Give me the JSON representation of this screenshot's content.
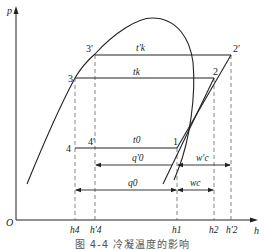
{
  "figure": {
    "caption": "图 4-4  冷凝温度的影响",
    "axes": {
      "y_label": "p",
      "x_label": "h",
      "origin_label": "O"
    },
    "points": {
      "p1": "1",
      "p2": "2",
      "p2p": "2′",
      "p3": "3",
      "p3p": "3′",
      "p4": "4",
      "p4p": "4′"
    },
    "line_labels": {
      "tk_prime": "t′k",
      "tk": "tk",
      "t0": "t0"
    },
    "dimension_labels": {
      "q0_prime": "q′0",
      "wc_prime": "w′c",
      "q0": "q0",
      "wc": "wc"
    },
    "h_ticks": [
      "h4",
      "h′4",
      "h1",
      "h2",
      "h′2"
    ],
    "colors": {
      "line": "#222222",
      "dashed": "#555555",
      "background": "#ffffff"
    }
  }
}
